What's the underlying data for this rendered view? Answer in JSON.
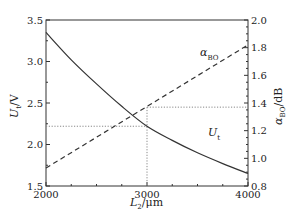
{
  "chart_data": {
    "type": "line",
    "title": "",
    "xlabel": "L2/μm",
    "ylabel_left": "Ut/V",
    "ylabel_right": "αBO/dB",
    "xlim": [
      2000,
      4000
    ],
    "ylim_left": [
      1.5,
      3.5
    ],
    "ylim_right": [
      0.8,
      2.0
    ],
    "x_ticks": [
      "2000",
      "3000",
      "4000"
    ],
    "y_left_ticks": [
      "1.5",
      "2.0",
      "2.5",
      "3.0",
      "3.5"
    ],
    "y_right_ticks": [
      "0.8",
      "1.0",
      "1.2",
      "1.4",
      "1.6",
      "1.8",
      "2.0"
    ],
    "grid": false,
    "series": [
      {
        "name": "Ut",
        "axis": "left",
        "style": "solid",
        "x": [
          2000,
          2250,
          2500,
          2750,
          3000,
          3250,
          3500,
          3750,
          4000
        ],
        "values": [
          3.35,
          3.02,
          2.73,
          2.46,
          2.22,
          2.05,
          1.9,
          1.77,
          1.65
        ]
      },
      {
        "name": "αBO",
        "axis": "right",
        "style": "dashed",
        "x": [
          2000,
          4000
        ],
        "values": [
          0.93,
          1.82
        ]
      }
    ],
    "annotations": [
      {
        "text": "αBO",
        "near_series": "αBO",
        "x": 3500,
        "y_right": 1.68
      },
      {
        "text": "Ut",
        "near_series": "Ut",
        "x": 3600,
        "y_left": 2.05
      }
    ],
    "reference_lines": [
      {
        "type": "vertical",
        "x": 3000,
        "style": "dotted"
      },
      {
        "type": "horizontal",
        "axis": "left",
        "y": 2.22,
        "from_x": 2000,
        "to_x": 3000,
        "style": "dotted"
      },
      {
        "type": "horizontal",
        "axis": "right",
        "y": 1.37,
        "from_x": 3000,
        "to_x": 4000,
        "style": "dotted"
      }
    ]
  },
  "labels": {
    "x_main": "L",
    "x_sub": "2",
    "x_unit": "/μm",
    "yl_main": "U",
    "yl_sub": "t",
    "yl_unit": "/V",
    "yr_main": "α",
    "yr_sub": "BO",
    "yr_unit": "/dB",
    "ann_alpha_main": "α",
    "ann_alpha_sub": "BO",
    "ann_u_main": "U",
    "ann_u_sub": "t"
  }
}
